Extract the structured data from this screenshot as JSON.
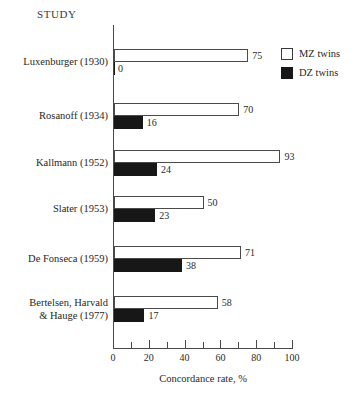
{
  "header": {
    "study_column_label": "STUDY"
  },
  "legend": {
    "position": "top-right",
    "entries": [
      {
        "label": "MZ twins",
        "swatch": "white-square",
        "color": "#ffffff"
      },
      {
        "label": "DZ twins",
        "swatch": "black-square",
        "color": "#171717"
      }
    ]
  },
  "axis": {
    "xlabel": "Concordance rate, %",
    "xlim": [
      0,
      100
    ],
    "major_ticks": [
      0,
      20,
      40,
      60,
      80,
      100
    ],
    "minor_tick_step": 10,
    "tick_labels": [
      "0",
      "20",
      "40",
      "60",
      "80",
      "100"
    ]
  },
  "chart_data": {
    "type": "bar",
    "orientation": "horizontal",
    "title": "",
    "subtitle": "",
    "xlabel": "Concordance rate, %",
    "ylabel": "STUDY",
    "xlim": [
      0,
      100
    ],
    "grid": false,
    "legend_position": "top-right",
    "categories": [
      "Luxenburger (1930)",
      "Rosanoff (1934)",
      "Kallmann (1952)",
      "Slater (1953)",
      "De Fonseca (1959)",
      "Bertelsen, Harvald & Hauge (1977)"
    ],
    "category_lines": [
      [
        "Luxenburger (1930)"
      ],
      [
        "Rosanoff (1934)"
      ],
      [
        "Kallmann (1952)"
      ],
      [
        "Slater (1953)"
      ],
      [
        "De Fonseca (1959)"
      ],
      [
        "Bertelsen, Harvald",
        "& Hauge (1977)"
      ]
    ],
    "series": [
      {
        "name": "MZ twins",
        "color": "#ffffff",
        "values": [
          75,
          70,
          93,
          50,
          71,
          58
        ]
      },
      {
        "name": "DZ twins",
        "color": "#171717",
        "values": [
          0,
          16,
          24,
          23,
          38,
          17
        ]
      }
    ],
    "value_labels": {
      "mz": [
        "75",
        "70",
        "93",
        "50",
        "71",
        "58"
      ],
      "dz": [
        "0",
        "16",
        "24",
        "23",
        "38",
        "17"
      ]
    }
  }
}
